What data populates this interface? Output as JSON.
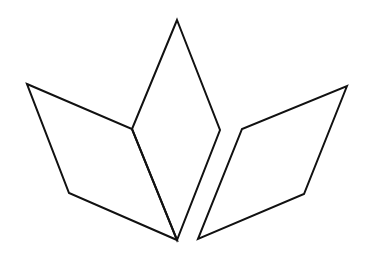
{
  "diagram": {
    "width": 370,
    "height": 253,
    "background": "#ffffff",
    "stroke_color": "#111111",
    "stroke_width": 2,
    "shapes": [
      {
        "name": "left-rhombus",
        "type": "parallelogram",
        "points": [
          [
            27,
            84
          ],
          [
            132,
            129
          ],
          [
            177,
            240
          ],
          [
            69,
            193
          ]
        ]
      },
      {
        "name": "center-rhombus",
        "type": "rhombus",
        "points": [
          [
            177,
            20
          ],
          [
            220,
            130
          ],
          [
            177,
            240
          ],
          [
            132,
            129
          ]
        ]
      },
      {
        "name": "right-rhombus",
        "type": "parallelogram",
        "points": [
          [
            347,
            86
          ],
          [
            304,
            194
          ],
          [
            198,
            239
          ],
          [
            242,
            129
          ]
        ]
      }
    ]
  }
}
